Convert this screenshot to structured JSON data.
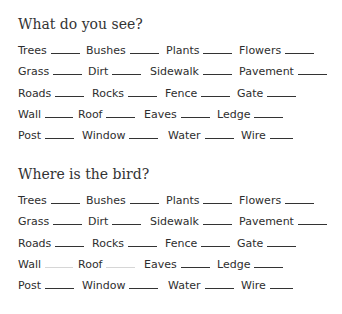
{
  "sections": [
    {
      "heading": "What do you see?",
      "rows": [
        [
          {
            "word": "Trees",
            "x": 0,
            "blank": 29
          },
          {
            "word": "Bushes",
            "x": 68,
            "blank": 29
          },
          {
            "word": "Plants",
            "x": 148,
            "blank": 29
          },
          {
            "word": "Flowers",
            "x": 221,
            "blank": 29
          }
        ],
        [
          {
            "word": "Grass",
            "x": 0,
            "blank": 29
          },
          {
            "word": "Dirt",
            "x": 70,
            "blank": 29
          },
          {
            "word": "Sidewalk",
            "x": 132,
            "blank": 29
          },
          {
            "word": "Pavement",
            "x": 221,
            "blank": 29
          }
        ],
        [
          {
            "word": "Roads",
            "x": 0,
            "blank": 29
          },
          {
            "word": "Rocks",
            "x": 74,
            "blank": 29
          },
          {
            "word": "Fence",
            "x": 147,
            "blank": 29
          },
          {
            "word": "Gate",
            "x": 219,
            "blank": 29
          }
        ],
        [
          {
            "word": "Wall",
            "x": 0,
            "blank": 28
          },
          {
            "word": "Roof",
            "x": 60,
            "blank": 29
          },
          {
            "word": "Eaves",
            "x": 126,
            "blank": 29
          },
          {
            "word": "Ledge",
            "x": 199,
            "blank": 29
          }
        ],
        [
          {
            "word": "Post",
            "x": 0,
            "blank": 29
          },
          {
            "word": "Window",
            "x": 64,
            "blank": 29
          },
          {
            "word": "Water",
            "x": 150,
            "blank": 29
          },
          {
            "word": "Wire",
            "x": 223,
            "blank": 23
          }
        ]
      ]
    },
    {
      "heading": "Where is the bird?",
      "rows": [
        [
          {
            "word": "Trees",
            "x": 0,
            "blank": 29
          },
          {
            "word": "Bushes",
            "x": 68,
            "blank": 29
          },
          {
            "word": "Plants",
            "x": 148,
            "blank": 29
          },
          {
            "word": "Flowers",
            "x": 221,
            "blank": 29
          }
        ],
        [
          {
            "word": "Grass",
            "x": 0,
            "blank": 29
          },
          {
            "word": "Dirt",
            "x": 70,
            "blank": 29
          },
          {
            "word": "Sidewalk",
            "x": 132,
            "blank": 29
          },
          {
            "word": "Pavement",
            "x": 221,
            "blank": 29
          }
        ],
        [
          {
            "word": "Roads",
            "x": 0,
            "blank": 29
          },
          {
            "word": "Rocks",
            "x": 74,
            "blank": 29
          },
          {
            "word": "Fence",
            "x": 147,
            "blank": 29
          },
          {
            "word": "Gate",
            "x": 219,
            "blank": 29
          }
        ],
        [
          {
            "word": "Wall",
            "x": 0,
            "blank": 28,
            "faint": true
          },
          {
            "word": "Roof",
            "x": 60,
            "blank": 29,
            "faint": true
          },
          {
            "word": "Eaves",
            "x": 126,
            "blank": 29
          },
          {
            "word": "Ledge",
            "x": 199,
            "blank": 29
          }
        ],
        [
          {
            "word": "Post",
            "x": 0,
            "blank": 29
          },
          {
            "word": "Window",
            "x": 64,
            "blank": 29
          },
          {
            "word": "Water",
            "x": 150,
            "blank": 29
          },
          {
            "word": "Wire",
            "x": 223,
            "blank": 23
          }
        ]
      ]
    }
  ]
}
